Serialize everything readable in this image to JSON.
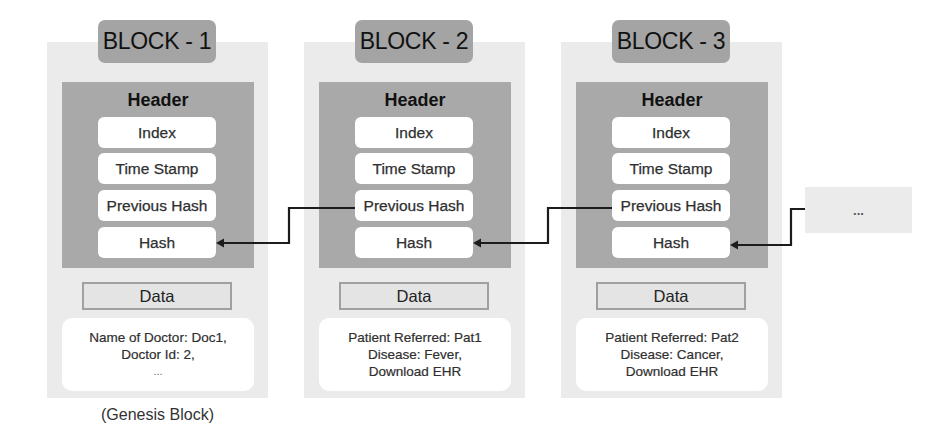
{
  "diagram": {
    "blocks": [
      {
        "title": "BLOCK - 1",
        "header_label": "Header",
        "fields": [
          "Index",
          "Time Stamp",
          "Previous Hash",
          "Hash"
        ],
        "data_label": "Data",
        "data_lines": [
          "Name of Doctor: Doc1,",
          "Doctor Id: 2,",
          "..."
        ],
        "caption": "(Genesis Block)"
      },
      {
        "title": "BLOCK - 2",
        "header_label": "Header",
        "fields": [
          "Index",
          "Time Stamp",
          "Previous Hash",
          "Hash"
        ],
        "data_label": "Data",
        "data_lines": [
          "Patient Referred: Pat1",
          "Disease: Fever,",
          "Download EHR"
        ]
      },
      {
        "title": "BLOCK - 3",
        "header_label": "Header",
        "fields": [
          "Index",
          "Time Stamp",
          "Previous Hash",
          "Hash"
        ],
        "data_label": "Data",
        "data_lines": [
          "Patient Referred: Pat2",
          "Disease: Cancer,",
          "Download EHR"
        ]
      }
    ],
    "continuation": {
      "label": "..."
    },
    "links": [
      {
        "from": "BLOCK - 2 / Previous Hash",
        "to": "BLOCK - 1 / Hash"
      },
      {
        "from": "BLOCK - 3 / Previous Hash",
        "to": "BLOCK - 2 / Hash"
      },
      {
        "from": "...",
        "to": "BLOCK - 3 / Hash"
      }
    ]
  },
  "colors": {
    "container": "#ebebeb",
    "title-bg": "#a4a4a4",
    "header-bg": "#a9a9a9",
    "field-bg": "#ffffff",
    "arrow": "#1c1c1c"
  }
}
